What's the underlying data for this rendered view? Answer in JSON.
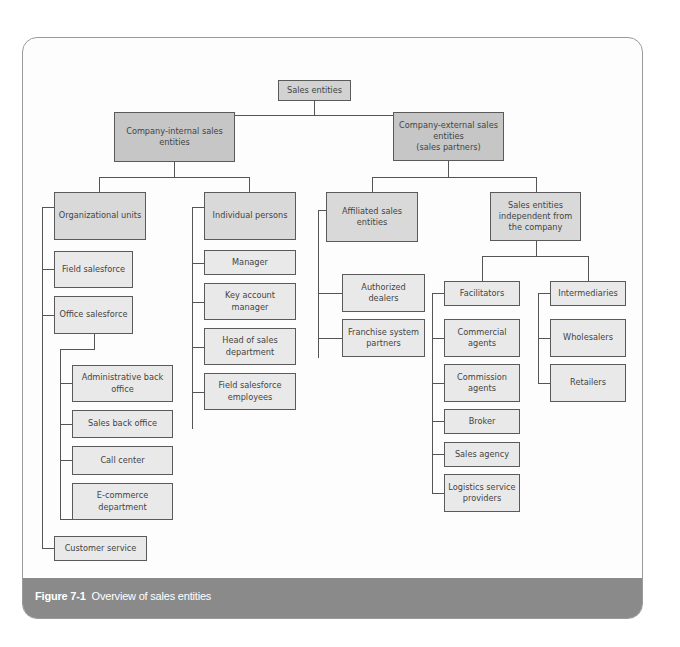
{
  "figure": {
    "number": "Figure 7-1",
    "title": "Overview of sales entities"
  },
  "chart": {
    "root": "Sales entities",
    "internal": {
      "label": "Company-internal sales entities",
      "org_units": {
        "label": "Organizational units",
        "field_salesforce": "Field salesforce",
        "office_salesforce": {
          "label": "Office salesforce",
          "children": [
            "Administrative back office",
            "Sales back office",
            "Call center",
            "E-commerce department"
          ]
        },
        "customer_service": "Customer service"
      },
      "individual_persons": {
        "label": "Individual persons",
        "children": [
          "Manager",
          "Key account manager",
          "Head of sales department",
          "Field salesforce employees"
        ]
      }
    },
    "external": {
      "label": "Company-external sales entities (sales partners)",
      "label_line1": "Company-external sales entities",
      "label_line2": "(sales partners)",
      "affiliated": {
        "label": "Affiliated sales entities",
        "children": [
          "Authorized dealers",
          "Franchise system partners"
        ]
      },
      "independent": {
        "label": "Sales entities independent from the company",
        "facilitators": {
          "label": "Facilitators",
          "children": [
            "Commercial agents",
            "Commission agents",
            "Broker",
            "Sales agency",
            "Logistics service providers"
          ]
        },
        "intermediaries": {
          "label": "Intermediaries",
          "children": [
            "Wholesalers",
            "Retailers"
          ]
        }
      }
    }
  }
}
